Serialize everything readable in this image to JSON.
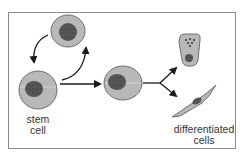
{
  "diagram": {
    "labels": {
      "stem_line1": "stem",
      "stem_line2": "cell",
      "diff_line1": "differentiated",
      "diff_line2": "cells"
    },
    "colors": {
      "cytoplasm": "#b8b8b8",
      "cell_outline": "#6e6e6e",
      "nucleus": "#555555",
      "arrow": "#1a1a1a",
      "frame": "#8a8a8a"
    },
    "nodes": [
      {
        "id": "self-renewed-cell",
        "description": "stem cell produced by self-renewal (top)"
      },
      {
        "id": "stem-cell",
        "description": "original stem cell (bottom left)"
      },
      {
        "id": "progenitor-cell",
        "description": "dividing cell (center)"
      },
      {
        "id": "secretory-cell",
        "description": "differentiated cell with granules (top right)"
      },
      {
        "id": "spindle-cell",
        "description": "elongated differentiated cell (bottom right)"
      }
    ],
    "edges": [
      {
        "from": "self-renewed-cell",
        "to": "stem-cell",
        "type": "curved-arrow"
      },
      {
        "from": "stem-cell",
        "to": "self-renewed-cell",
        "type": "curved-arrow"
      },
      {
        "from": "stem-cell",
        "to": "progenitor-cell",
        "type": "arrow"
      },
      {
        "from": "progenitor-cell",
        "to": "secretory-cell",
        "type": "branch-arrow"
      },
      {
        "from": "progenitor-cell",
        "to": "spindle-cell",
        "type": "branch-arrow"
      }
    ]
  }
}
